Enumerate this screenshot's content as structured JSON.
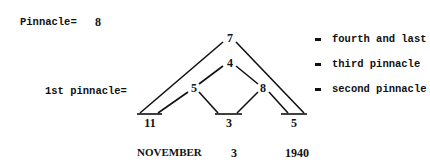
{
  "header": {
    "pinnacle_label": "Pinnacle=",
    "pinnacle_value": "8",
    "first_pinnacle_label": "1st pinnacle="
  },
  "diagram": {
    "nodes": {
      "top": "7",
      "upper_middle": "4",
      "left_middle": "5",
      "right_middle": "8",
      "base_left": "11",
      "base_center": "3",
      "base_right": "5"
    },
    "date": {
      "month": "NOVEMBER",
      "day": "3",
      "year": "1940"
    }
  },
  "legend": [
    {
      "symbol": "=",
      "label": "fourth and last"
    },
    {
      "symbol": "=",
      "label": "third pinnacle"
    },
    {
      "symbol": "=",
      "label": "second pinnacle"
    }
  ],
  "colors": {
    "ink": "#111111",
    "background": "#ffffff"
  }
}
